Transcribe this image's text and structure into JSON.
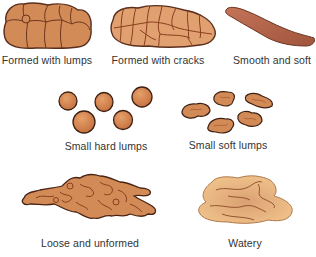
{
  "figure": {
    "colors": {
      "brown_fill": "#d28a56",
      "brown_outline": "#5a2e1c",
      "crack_line": "#8a3f1e",
      "smooth_fill": "#b5654a",
      "watery_fill": "#e6b47c",
      "label_text": "#333333",
      "background": "#ffffff"
    },
    "items": [
      {
        "label": "Formed with lumps",
        "row": 1,
        "col": 1
      },
      {
        "label": "Formed with cracks",
        "row": 1,
        "col": 2
      },
      {
        "label": "Smooth and soft",
        "row": 1,
        "col": 3
      },
      {
        "label": "Small hard lumps",
        "row": 2,
        "col": 1
      },
      {
        "label": "Small soft lumps",
        "row": 2,
        "col": 2
      },
      {
        "label": "Loose and unformed",
        "row": 3,
        "col": 1
      },
      {
        "label": "Watery",
        "row": 3,
        "col": 2
      }
    ]
  }
}
